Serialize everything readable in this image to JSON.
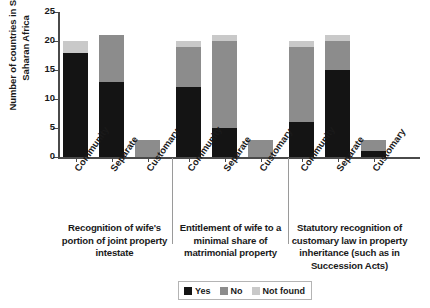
{
  "chart_data": {
    "type": "bar",
    "stacked": true,
    "title": "",
    "xlabel": "",
    "ylabel": "Number of countries in Sub-Saharan Africa",
    "ylim": [
      0,
      25
    ],
    "ytick_labels": [
      "0",
      "5",
      "10",
      "15",
      "20",
      "25"
    ],
    "ytick_values": [
      0,
      5,
      10,
      15,
      20,
      25
    ],
    "grid": false,
    "legend_position": "bottom-center",
    "series": [
      {
        "name": "Yes",
        "color": "#141414",
        "values": [
          18,
          13,
          0,
          12,
          5,
          0,
          6,
          15,
          1
        ]
      },
      {
        "name": "No",
        "color": "#8c8c8c",
        "values": [
          0,
          8,
          3,
          7,
          15,
          3,
          13,
          5,
          2
        ]
      },
      {
        "name": "Not found",
        "color": "#c9c9c9",
        "values": [
          2,
          0,
          0,
          1,
          1,
          0,
          1,
          1,
          0
        ]
      }
    ],
    "categories": [
      "Community",
      "Separate",
      "Customary",
      "Community",
      "Separate",
      "Customary",
      "Community",
      "Separate",
      "Customary"
    ],
    "group_totals": [
      20,
      21,
      3,
      20,
      21,
      3,
      20,
      21,
      3
    ],
    "groups": [
      {
        "caption": "Recognition of wife's portion of joint property intestate"
      },
      {
        "caption": "Entitlement of wife to a minimal share of matrimonial property"
      },
      {
        "caption": "Statutory recognition of customary law in property inheritance (such as in Succession Acts)"
      }
    ]
  },
  "legend": {
    "items": [
      {
        "label": "Yes"
      },
      {
        "label": "No"
      },
      {
        "label": "Not found"
      }
    ]
  }
}
